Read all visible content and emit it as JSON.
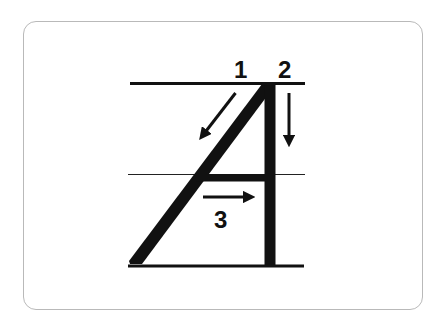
{
  "diagram": {
    "letter": "A",
    "colors": {
      "ink": "#111111",
      "card_border": "#b9b9b9",
      "background": "#ffffff"
    },
    "guide_lines": [
      {
        "name": "top-line",
        "weight": "thick"
      },
      {
        "name": "middle-line",
        "weight": "thin"
      },
      {
        "name": "baseline",
        "weight": "thick"
      }
    ],
    "strokes": [
      {
        "order": "1",
        "label": "1",
        "description": "Diagonal stroke from top down to the left",
        "direction": "down-left"
      },
      {
        "order": "2",
        "label": "2",
        "description": "Vertical stroke straight down",
        "direction": "down"
      },
      {
        "order": "3",
        "label": "3",
        "description": "Horizontal crossbar from left to right",
        "direction": "right"
      }
    ]
  }
}
